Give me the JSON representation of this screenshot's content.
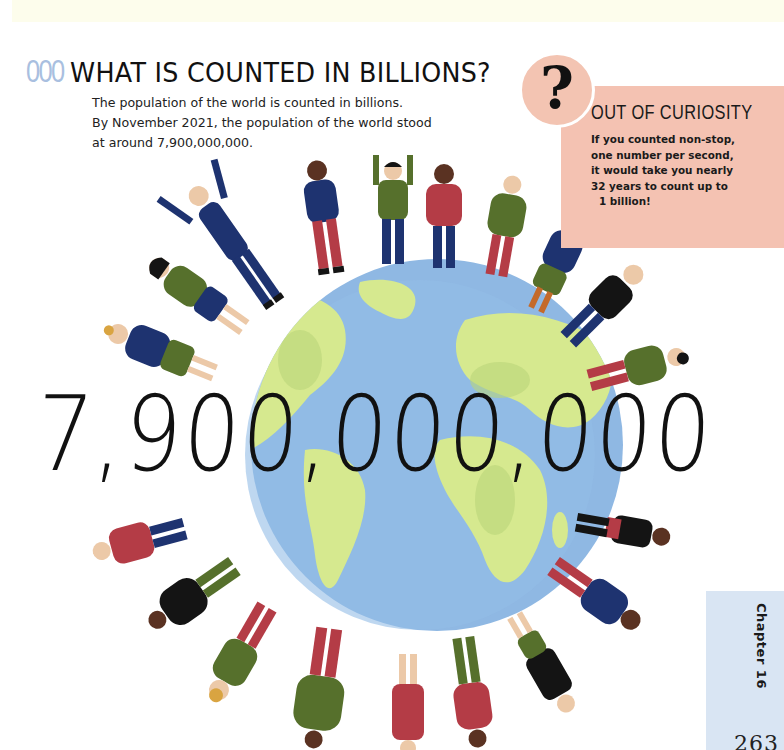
{
  "section": {
    "number": "000",
    "title": "WHAT IS COUNTED IN BILLIONS?",
    "intro_lines": [
      "The population of the world is counted in billions.",
      "By November 2021, the population of the world stood",
      "at around 7,900,000,000."
    ]
  },
  "sidebar_box": {
    "icon": "question-mark-icon",
    "icon_glyph": "?",
    "title": "OUT OF CURIOSITY",
    "body_lines": [
      "If you counted non-stop,",
      "one number per second,",
      "it would take you nearly",
      "32 years to count up to",
      "1 billion!"
    ]
  },
  "illustration": {
    "description": "Globe surrounded by people standing around its edge",
    "big_number": "7,900,000,000",
    "colors": {
      "ocean": "#8fb8e3",
      "land": "#d6e98f",
      "navy": "#1e3370",
      "green": "#56702c",
      "red": "#b43c46",
      "black": "#141414",
      "skin_light": "#ecc9a8",
      "skin_dark": "#5a3222"
    }
  },
  "footer": {
    "chapter_label": "Chapter 16",
    "page_number": "263"
  },
  "colors": {
    "accent_blue": "#a9bfe0",
    "pink_box": "#f4c2b2",
    "tab_blue": "#d9e5f3",
    "top_band": "#fdfdec"
  }
}
